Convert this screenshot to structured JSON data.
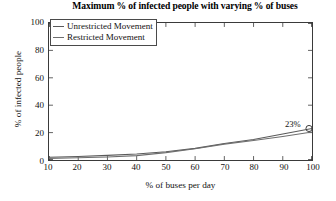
{
  "chart_data": {
    "type": "line",
    "title": "Maximum % of infected people with varying % of buses",
    "xlabel": "% of buses per day",
    "ylabel": "% of infected people",
    "xlim": [
      10,
      100
    ],
    "ylim": [
      0,
      100
    ],
    "grid": false,
    "legend_position": "top-left",
    "x": [
      10,
      20,
      30,
      40,
      50,
      60,
      70,
      80,
      90,
      100
    ],
    "xticks": [
      "10",
      "20",
      "30",
      "40",
      "50",
      "60",
      "70",
      "80",
      "90",
      "100"
    ],
    "yticks": [
      "0",
      "20",
      "40",
      "60",
      "80",
      "100"
    ],
    "series": [
      {
        "name": "Unrestricted Movement",
        "color": "#5a5a5a",
        "values": [
          2.0,
          2.6,
          3.4,
          4.4,
          6.0,
          8.5,
          12.0,
          15.0,
          19.0,
          23.0
        ]
      },
      {
        "name": "Restricted Movement",
        "color": "#6e6e6e",
        "values": [
          1.2,
          1.6,
          2.2,
          3.2,
          5.4,
          8.2,
          11.6,
          14.2,
          17.2,
          20.4
        ]
      }
    ],
    "annotations": [
      {
        "label": "23%",
        "x": 100,
        "y": 23,
        "marker": "circle"
      }
    ]
  }
}
